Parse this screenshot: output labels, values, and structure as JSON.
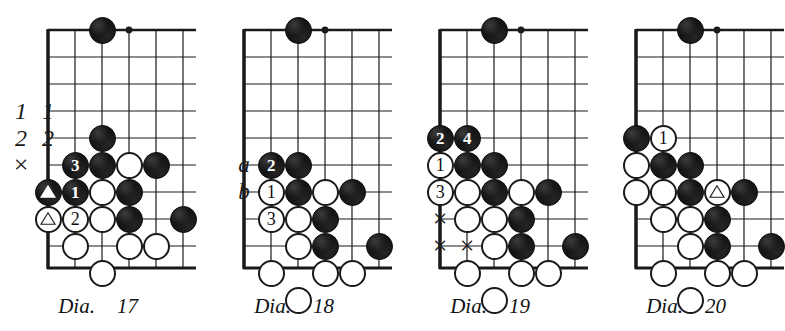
{
  "page": {
    "background_color": "#ffffff",
    "line_color": "#1a1a1a",
    "black_stone_color": "#151515",
    "white_stone_color": "#ffffff"
  },
  "diagrams": [
    {
      "id": "dia-17",
      "caption_word": "Dia.",
      "caption_number": "17",
      "board": {
        "columns": 6,
        "rows": 8,
        "edges": [
          "left",
          "top",
          "bottom"
        ],
        "star_point": {
          "col": 4,
          "row": 1
        }
      },
      "stones": [
        {
          "color": "black",
          "col": 3,
          "row": 1,
          "label": "",
          "mark": ""
        },
        {
          "color": "black",
          "col": 3,
          "row": 5,
          "label": "",
          "mark": ""
        },
        {
          "color": "black",
          "col": 2,
          "row": 6,
          "label": "3",
          "mark": ""
        },
        {
          "color": "black",
          "col": 3,
          "row": 6,
          "label": "",
          "mark": ""
        },
        {
          "color": "white",
          "col": 4,
          "row": 6,
          "label": "",
          "mark": ""
        },
        {
          "color": "black",
          "col": 5,
          "row": 6,
          "label": "",
          "mark": ""
        },
        {
          "color": "black",
          "col": 1,
          "row": 7,
          "label": "",
          "mark": "triangle"
        },
        {
          "color": "black",
          "col": 2,
          "row": 7,
          "label": "1",
          "mark": ""
        },
        {
          "color": "white",
          "col": 3,
          "row": 7,
          "label": "",
          "mark": ""
        },
        {
          "color": "black",
          "col": 4,
          "row": 7,
          "label": "",
          "mark": ""
        },
        {
          "color": "white",
          "col": 1,
          "row": 8,
          "label": "",
          "mark": "triangle"
        },
        {
          "color": "white",
          "col": 2,
          "row": 8,
          "label": "2",
          "mark": ""
        },
        {
          "color": "white",
          "col": 3,
          "row": 8,
          "label": "",
          "mark": ""
        },
        {
          "color": "black",
          "col": 4,
          "row": 8,
          "label": "",
          "mark": ""
        },
        {
          "color": "black",
          "col": 6,
          "row": 8,
          "label": "",
          "mark": ""
        },
        {
          "color": "white",
          "col": 2,
          "row": 9,
          "label": "",
          "mark": ""
        },
        {
          "color": "white",
          "col": 4,
          "row": 9,
          "label": "",
          "mark": ""
        },
        {
          "color": "white",
          "col": 5,
          "row": 9,
          "label": "",
          "mark": ""
        },
        {
          "color": "white",
          "col": 3,
          "row": 10,
          "label": "",
          "mark": ""
        }
      ],
      "off_board_marks": [
        {
          "text": "1",
          "kind": "numlabel",
          "col": 0,
          "row": 4
        },
        {
          "text": "1",
          "kind": "numlabel",
          "col": 1,
          "row": 4
        },
        {
          "text": "2",
          "kind": "numlabel",
          "col": 0,
          "row": 5
        },
        {
          "text": "2",
          "kind": "numlabel",
          "col": 1,
          "row": 5
        },
        {
          "text": "×",
          "kind": "cross",
          "col": 0,
          "row": 6
        }
      ]
    },
    {
      "id": "dia-18",
      "caption_word": "Dia.",
      "caption_number": "18",
      "board": {
        "columns": 6,
        "rows": 8,
        "edges": [
          "left",
          "top",
          "bottom"
        ],
        "star_point": {
          "col": 4,
          "row": 1
        }
      },
      "stones": [
        {
          "color": "black",
          "col": 3,
          "row": 1,
          "label": "",
          "mark": ""
        },
        {
          "color": "black",
          "col": 2,
          "row": 6,
          "label": "2",
          "mark": ""
        },
        {
          "color": "black",
          "col": 3,
          "row": 6,
          "label": "",
          "mark": ""
        },
        {
          "color": "white",
          "col": 2,
          "row": 7,
          "label": "1",
          "mark": ""
        },
        {
          "color": "black",
          "col": 3,
          "row": 7,
          "label": "",
          "mark": ""
        },
        {
          "color": "white",
          "col": 4,
          "row": 7,
          "label": "",
          "mark": ""
        },
        {
          "color": "black",
          "col": 5,
          "row": 7,
          "label": "",
          "mark": ""
        },
        {
          "color": "white",
          "col": 2,
          "row": 8,
          "label": "3",
          "mark": ""
        },
        {
          "color": "white",
          "col": 3,
          "row": 8,
          "label": "",
          "mark": ""
        },
        {
          "color": "black",
          "col": 4,
          "row": 8,
          "label": "",
          "mark": ""
        },
        {
          "color": "white",
          "col": 3,
          "row": 9,
          "label": "",
          "mark": ""
        },
        {
          "color": "black",
          "col": 4,
          "row": 9,
          "label": "",
          "mark": ""
        },
        {
          "color": "black",
          "col": 6,
          "row": 9,
          "label": "",
          "mark": ""
        },
        {
          "color": "white",
          "col": 2,
          "row": 10,
          "label": "",
          "mark": ""
        },
        {
          "color": "white",
          "col": 4,
          "row": 10,
          "label": "",
          "mark": ""
        },
        {
          "color": "white",
          "col": 5,
          "row": 10,
          "label": "",
          "mark": ""
        },
        {
          "color": "white",
          "col": 3,
          "row": 11,
          "label": "",
          "mark": ""
        }
      ],
      "off_board_marks": [
        {
          "text": "a",
          "kind": "letterlabel",
          "col": 1,
          "row": 6
        },
        {
          "text": "b",
          "kind": "letterlabel",
          "col": 1,
          "row": 7
        }
      ]
    },
    {
      "id": "dia-19",
      "caption_word": "Dia.",
      "caption_number": "19",
      "board": {
        "columns": 6,
        "rows": 8,
        "edges": [
          "left",
          "top",
          "bottom"
        ],
        "star_point": {
          "col": 4,
          "row": 1
        }
      },
      "stones": [
        {
          "color": "black",
          "col": 3,
          "row": 1,
          "label": "",
          "mark": ""
        },
        {
          "color": "black",
          "col": 1,
          "row": 5,
          "label": "2",
          "mark": ""
        },
        {
          "color": "black",
          "col": 2,
          "row": 5,
          "label": "4",
          "mark": ""
        },
        {
          "color": "white",
          "col": 1,
          "row": 6,
          "label": "1",
          "mark": ""
        },
        {
          "color": "black",
          "col": 2,
          "row": 6,
          "label": "",
          "mark": ""
        },
        {
          "color": "black",
          "col": 3,
          "row": 6,
          "label": "",
          "mark": ""
        },
        {
          "color": "white",
          "col": 1,
          "row": 7,
          "label": "3",
          "mark": ""
        },
        {
          "color": "white",
          "col": 2,
          "row": 7,
          "label": "",
          "mark": ""
        },
        {
          "color": "black",
          "col": 3,
          "row": 7,
          "label": "",
          "mark": ""
        },
        {
          "color": "white",
          "col": 4,
          "row": 7,
          "label": "",
          "mark": ""
        },
        {
          "color": "black",
          "col": 5,
          "row": 7,
          "label": "",
          "mark": ""
        },
        {
          "color": "white",
          "col": 2,
          "row": 8,
          "label": "",
          "mark": ""
        },
        {
          "color": "white",
          "col": 3,
          "row": 8,
          "label": "",
          "mark": ""
        },
        {
          "color": "black",
          "col": 4,
          "row": 8,
          "label": "",
          "mark": ""
        },
        {
          "color": "white",
          "col": 3,
          "row": 9,
          "label": "",
          "mark": ""
        },
        {
          "color": "black",
          "col": 4,
          "row": 9,
          "label": "",
          "mark": ""
        },
        {
          "color": "black",
          "col": 6,
          "row": 9,
          "label": "",
          "mark": ""
        },
        {
          "color": "white",
          "col": 2,
          "row": 10,
          "label": "",
          "mark": ""
        },
        {
          "color": "white",
          "col": 4,
          "row": 10,
          "label": "",
          "mark": ""
        },
        {
          "color": "white",
          "col": 5,
          "row": 10,
          "label": "",
          "mark": ""
        },
        {
          "color": "white",
          "col": 3,
          "row": 11,
          "label": "",
          "mark": ""
        }
      ],
      "off_board_marks": [
        {
          "text": "×",
          "kind": "cross",
          "col": 1,
          "row": 8
        },
        {
          "text": "×",
          "kind": "cross",
          "col": 1,
          "row": 9
        },
        {
          "text": "×",
          "kind": "cross",
          "col": 2,
          "row": 9
        }
      ]
    },
    {
      "id": "dia-20",
      "caption_word": "Dia.",
      "caption_number": "20",
      "board": {
        "columns": 6,
        "rows": 8,
        "edges": [
          "left",
          "top",
          "bottom"
        ],
        "star_point": {
          "col": 4,
          "row": 1
        }
      },
      "stones": [
        {
          "color": "black",
          "col": 3,
          "row": 1,
          "label": "",
          "mark": ""
        },
        {
          "color": "black",
          "col": 1,
          "row": 5,
          "label": "",
          "mark": ""
        },
        {
          "color": "white",
          "col": 2,
          "row": 5,
          "label": "1",
          "mark": ""
        },
        {
          "color": "white",
          "col": 1,
          "row": 6,
          "label": "",
          "mark": ""
        },
        {
          "color": "black",
          "col": 2,
          "row": 6,
          "label": "",
          "mark": ""
        },
        {
          "color": "black",
          "col": 3,
          "row": 6,
          "label": "",
          "mark": ""
        },
        {
          "color": "white",
          "col": 1,
          "row": 7,
          "label": "",
          "mark": ""
        },
        {
          "color": "white",
          "col": 2,
          "row": 7,
          "label": "",
          "mark": ""
        },
        {
          "color": "black",
          "col": 3,
          "row": 7,
          "label": "",
          "mark": ""
        },
        {
          "color": "white",
          "col": 4,
          "row": 7,
          "label": "",
          "mark": "triangle"
        },
        {
          "color": "black",
          "col": 5,
          "row": 7,
          "label": "",
          "mark": ""
        },
        {
          "color": "white",
          "col": 2,
          "row": 8,
          "label": "",
          "mark": ""
        },
        {
          "color": "white",
          "col": 3,
          "row": 8,
          "label": "",
          "mark": ""
        },
        {
          "color": "black",
          "col": 4,
          "row": 8,
          "label": "",
          "mark": ""
        },
        {
          "color": "white",
          "col": 3,
          "row": 9,
          "label": "",
          "mark": ""
        },
        {
          "color": "black",
          "col": 4,
          "row": 9,
          "label": "",
          "mark": ""
        },
        {
          "color": "black",
          "col": 6,
          "row": 9,
          "label": "",
          "mark": ""
        },
        {
          "color": "white",
          "col": 2,
          "row": 10,
          "label": "",
          "mark": ""
        },
        {
          "color": "white",
          "col": 4,
          "row": 10,
          "label": "",
          "mark": ""
        },
        {
          "color": "white",
          "col": 5,
          "row": 10,
          "label": "",
          "mark": ""
        },
        {
          "color": "white",
          "col": 3,
          "row": 11,
          "label": "",
          "mark": ""
        }
      ],
      "off_board_marks": []
    }
  ]
}
